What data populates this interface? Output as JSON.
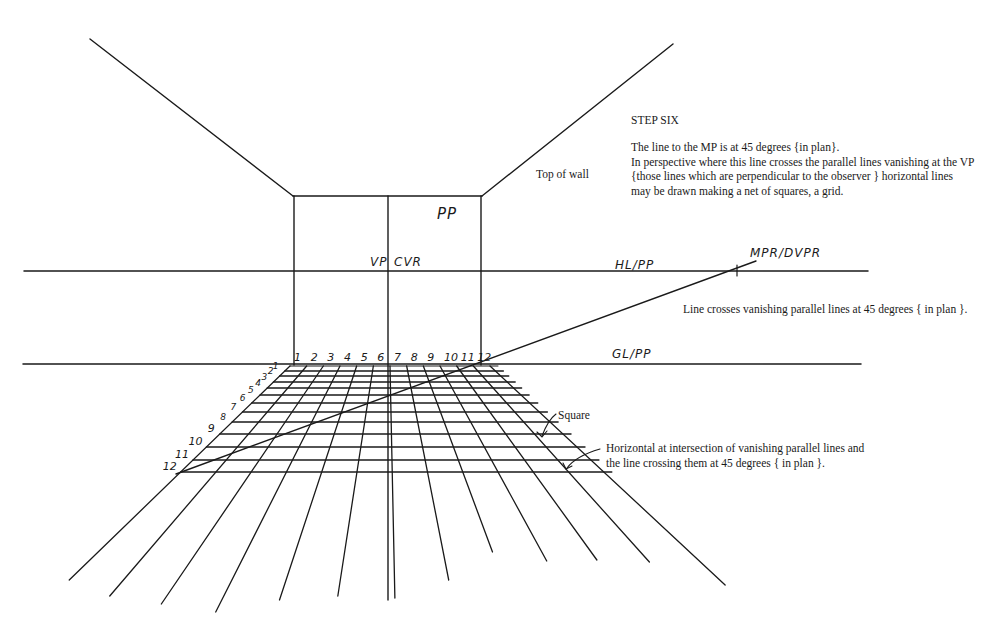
{
  "notes": {
    "step_title": "STEP  SIX",
    "paragraph": [
      "The line to the MP is at 45 degrees {in plan}.",
      "In perspective where  this line crosses the parallel lines vanishing at the VP",
      "{those lines which are perpendicular to the observer } horizontal lines",
      "may be drawn making a net of  squares, a grid."
    ],
    "top_of_wall": "Top of wall",
    "line_crosses": "Line crosses vanishing parallel lines at 45 degrees { in plan }.",
    "square": "Square",
    "horizontal_note": [
      "Horizontal at intersection of vanishing parallel lines and",
      "the line crossing them at 45 degrees { in plan }."
    ]
  },
  "handwritten": {
    "pp": "PP",
    "vp": "VP",
    "cvr": "CVR",
    "hl_pp": "HL/PP",
    "mpr_dvpr": "MPR/DVPR",
    "gl_pp": "GL/PP"
  },
  "grid": {
    "top_numbers": [
      "1",
      "2",
      "3",
      "4",
      "5",
      "6",
      "7",
      "8",
      "9",
      "10",
      "11",
      "12"
    ],
    "side_numbers": [
      "1",
      "2",
      "3",
      "4",
      "5",
      "6",
      "7",
      "8",
      "9",
      "10",
      "11",
      "12"
    ],
    "divisions": 12
  }
}
